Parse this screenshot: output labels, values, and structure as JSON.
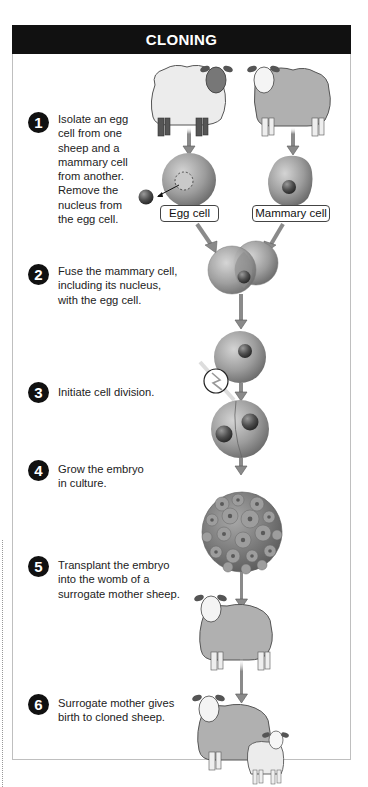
{
  "title": "CLONING",
  "steps": [
    {
      "number": "1",
      "text": "Isolate an egg\ncell from one\nsheep and a\nmammary cell\nfrom another.\nRemove the\nnucleus from\nthe egg cell."
    },
    {
      "number": "2",
      "text": "Fuse the mammary cell,\nincluding its nucleus,\nwith the egg cell."
    },
    {
      "number": "3",
      "text": "Initiate cell division."
    },
    {
      "number": "4",
      "text": "Grow the embryo\nin culture."
    },
    {
      "number": "5",
      "text": "Transplant the embryo\ninto the womb of a\nsurrogate mother sheep."
    },
    {
      "number": "6",
      "text": "Surrogate mother gives\nbirth to cloned sheep."
    }
  ],
  "labels": {
    "egg_cell": "Egg cell",
    "mammary_cell": "Mammary cell"
  },
  "colors": {
    "header_bg": "#111111",
    "cell_gray": "#9a9a9a",
    "nucleus": "#555555",
    "arrow": "#8a8a8a",
    "sheep_light": "#e6e6e6",
    "sheep_gray": "#b0b0b0"
  }
}
